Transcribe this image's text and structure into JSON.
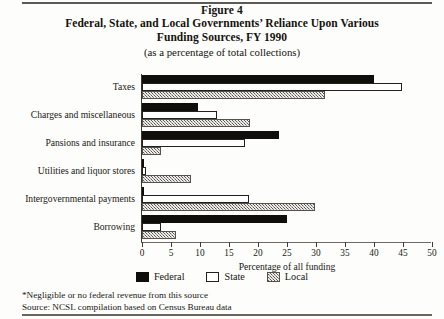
{
  "figure": {
    "label": "Figure 4",
    "title_line_1": "Federal, State, and Local Governments’ Reliance Upon Various",
    "title_line_2": "Funding Sources, FY 1990",
    "subtitle": "(as a percentage of total collections)"
  },
  "notes": {
    "footnote": "*Negligible or no federal revenue from this source",
    "source": "Source: NCSL compilation based on Census Bureau data"
  },
  "colors": {
    "federal": "#100e0b",
    "state": "#ffffff",
    "local": "#9b9790",
    "axis": "#3a3731",
    "text": "#15130f"
  },
  "chart_data": {
    "type": "bar",
    "orientation": "horizontal",
    "grouped": true,
    "title": "Federal, State, and Local Governments’ Reliance Upon Various Funding Sources, FY 1990",
    "subtitle": "(as a percentage of total collections)",
    "xlabel": "Percentage of all funding",
    "ylabel": "",
    "xlim": [
      0,
      50
    ],
    "xticks": [
      0,
      5,
      10,
      15,
      20,
      25,
      30,
      35,
      40,
      45,
      50
    ],
    "xtick_labels": [
      "0",
      "5",
      "10",
      "15",
      "20",
      "25",
      "30",
      "35",
      "40",
      "45",
      "50"
    ],
    "grid": false,
    "legend_position": "bottom",
    "categories": [
      "Taxes",
      "Charges and miscellaneous",
      "Pansions and insurance",
      "Utilities and liquor stores",
      "Intergovernmental payments",
      "Borrowing"
    ],
    "series": [
      {
        "name": "Federal",
        "color": "#100e0b",
        "values": [
          40.0,
          9.7,
          23.6,
          0.0,
          0.3,
          25.0
        ]
      },
      {
        "name": "State",
        "color": "#ffffff",
        "values": [
          44.8,
          13.0,
          17.7,
          0.7,
          18.4,
          3.3
        ]
      },
      {
        "name": "Local",
        "color": "#9b9790",
        "values": [
          31.5,
          18.7,
          3.3,
          8.4,
          29.9,
          5.9
        ]
      }
    ],
    "legend": [
      "Federal",
      "State",
      "Local"
    ],
    "annotations": [
      "*Negligible or no federal revenue from this source",
      "Source: NCSL compilation based on Census Bureau data"
    ]
  }
}
